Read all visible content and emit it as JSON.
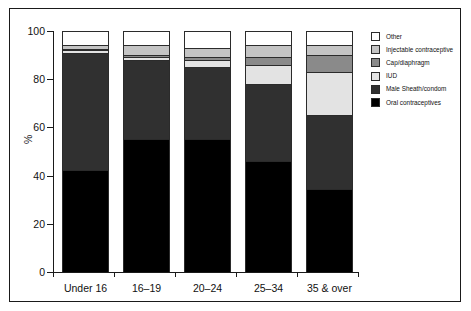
{
  "chart_data": {
    "type": "bar",
    "subtype": "stacked-100-percent",
    "title": "",
    "xlabel": "",
    "ylabel": "%",
    "ylim": [
      0,
      100
    ],
    "yticks": [
      0,
      20,
      40,
      60,
      80,
      100
    ],
    "grid": false,
    "legend_position": "right",
    "categories": [
      "Under 16",
      "16–19",
      "20–24",
      "25–34",
      "35 & over"
    ],
    "series": [
      {
        "name": "Oral contraceptives",
        "color": "#000000",
        "values": [
          42,
          55,
          55,
          46,
          34
        ]
      },
      {
        "name": "Male Sheath/condom",
        "color": "#303030",
        "values": [
          49,
          33,
          30,
          32,
          31
        ]
      },
      {
        "name": "IUD",
        "color": "#e3e3e3",
        "values": [
          1,
          1,
          3,
          8,
          18
        ]
      },
      {
        "name": "Cap/diaphragm",
        "color": "#8a8a8a",
        "values": [
          0.5,
          1,
          1,
          3,
          7
        ]
      },
      {
        "name": "Injectable contraceptive",
        "color": "#c4c4c4",
        "values": [
          1.5,
          4,
          4,
          5,
          4
        ]
      },
      {
        "name": "Other",
        "color": "#ffffff",
        "values": [
          6,
          6,
          7,
          6,
          6
        ]
      }
    ],
    "legend_order_top_to_bottom": [
      "Other",
      "Injectable contraceptive",
      "Cap/diaphragm",
      "IUD",
      "Male Sheath/condom",
      "Oral contraceptives"
    ]
  },
  "axes": {
    "y_label": "%",
    "y_tick_labels": [
      "100",
      "80",
      "60",
      "40",
      "20",
      "0"
    ],
    "x_tick_labels": [
      "Under 16",
      "16–19",
      "20–24",
      "25–34",
      "35 & over"
    ]
  },
  "legend": {
    "items": [
      {
        "label": "Other",
        "color": "#ffffff"
      },
      {
        "label": "Injectable contraceptive",
        "color": "#c4c4c4"
      },
      {
        "label": "Cap/diaphragm",
        "color": "#8a8a8a"
      },
      {
        "label": "IUD",
        "color": "#e3e3e3"
      },
      {
        "label": "Male Sheath/condom",
        "color": "#303030"
      },
      {
        "label": "Oral contraceptives",
        "color": "#000000"
      }
    ]
  }
}
